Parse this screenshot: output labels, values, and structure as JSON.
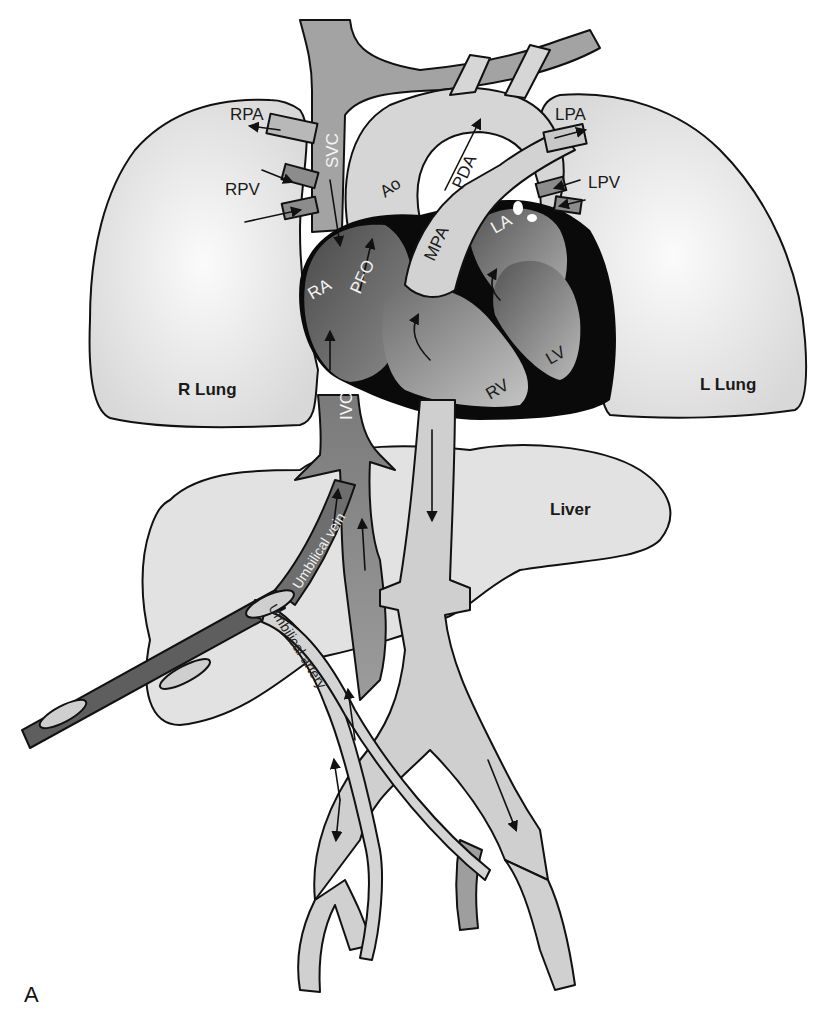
{
  "figure": {
    "panel_letter": "A",
    "colors": {
      "lung_fill": "#e4e4e4",
      "light_vessel": "#cfcfcf",
      "mid_vessel": "#9a9a9a",
      "dark_chamber": "#5a5a5a",
      "myocardium": "#0a0a0a",
      "background": "#ffffff"
    }
  },
  "organs": {
    "right_lung": "R Lung",
    "left_lung": "L Lung",
    "liver": "Liver"
  },
  "vessels": {
    "svc": "SVC",
    "ivc": "IVC",
    "aorta": "Ao",
    "mpa": "MPA",
    "pda": "PDA",
    "rpa": "RPA",
    "rpv": "RPV",
    "lpa": "LPA",
    "lpv": "LPV",
    "umbilical_vein": "Umbilical vein",
    "umbilical_artery": "Umbilical artery"
  },
  "chambers": {
    "ra": "RA",
    "la": "LA",
    "rv": "RV",
    "lv": "LV",
    "pfo": "PFO"
  }
}
